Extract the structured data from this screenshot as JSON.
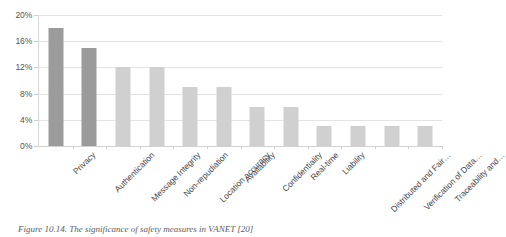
{
  "caption": "Figure 10.14. The significance of safety measures in VANET [20]",
  "colors": {
    "bar_dark": "#9b9b9b",
    "bar_light": "#d0d0d0",
    "gridline": "#e3e3e3",
    "axis": "#d2d2d2",
    "text": "#4a4a4a",
    "background": "#ffffff"
  },
  "chart_data": {
    "type": "bar",
    "title": "",
    "xlabel": "",
    "ylabel": "",
    "ylim": [
      0,
      20
    ],
    "ytick_labels": [
      "20%",
      "16%",
      "12%",
      "8%",
      "4%",
      "0%"
    ],
    "ytick_values": [
      20,
      16,
      12,
      8,
      4,
      0
    ],
    "grid": true,
    "legend": "none",
    "value_suffix": "%",
    "categories": [
      "Privacy",
      "Authentication",
      "Message Integrity",
      "Non-repudiation",
      "Location accuracy",
      "Availability",
      "Confidentiality",
      "Real-time",
      "Liability",
      "Distributed and Fair…",
      "Verification of Data…",
      "Traceability and…"
    ],
    "values": [
      18,
      15,
      12,
      12,
      9,
      9,
      6,
      6,
      3,
      3,
      3,
      3
    ],
    "bar_shades": [
      "dark",
      "dark",
      "light",
      "light",
      "light",
      "light",
      "light",
      "light",
      "light",
      "light",
      "light",
      "light"
    ]
  }
}
